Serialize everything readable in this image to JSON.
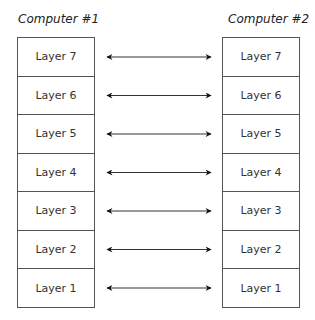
{
  "computer1": {
    "title": "Computer #1",
    "layers": [
      "Layer 7",
      "Layer 6",
      "Layer 5",
      "Layer 4",
      "Layer 3",
      "Layer 2",
      "Layer 1"
    ]
  },
  "computer2": {
    "title": "Computer #2",
    "layers": [
      "Layer 7",
      "Layer 6",
      "Layer 5",
      "Layer 4",
      "Layer 3",
      "Layer 2",
      "Layer 1"
    ]
  },
  "connections": "bidirectional arrows between matching layers"
}
